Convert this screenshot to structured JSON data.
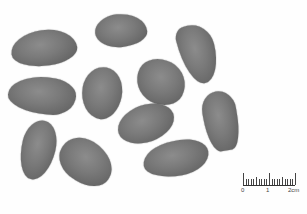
{
  "image": {
    "description": "Photograph of eleven grey ovate seeds on a white background with a centimeter scale bar",
    "background_color": "#fefefe",
    "seed_color": "#747474",
    "seed_count": 11
  },
  "seeds": [
    {
      "id": 1,
      "cx": 44,
      "cy": 48,
      "w": 66,
      "h": 36,
      "rotate": -8,
      "shape": "50% 50% 45% 55% / 55% 60% 40% 45%"
    },
    {
      "id": 2,
      "cx": 121,
      "cy": 30,
      "w": 52,
      "h": 33,
      "rotate": -6,
      "shape": "45% 55% 50% 50% / 50% 60% 40% 50%"
    },
    {
      "id": 3,
      "cx": 198,
      "cy": 54,
      "w": 36,
      "h": 60,
      "rotate": -14,
      "shape": "30% 60% 50% 50% / 20% 40% 60% 80%"
    },
    {
      "id": 4,
      "cx": 42,
      "cy": 95,
      "w": 68,
      "h": 37,
      "rotate": 5,
      "shape": "55% 40% 35% 60% / 55% 45% 55% 45%"
    },
    {
      "id": 5,
      "cx": 102,
      "cy": 93,
      "w": 40,
      "h": 52,
      "rotate": 10,
      "shape": "50% 50% 45% 55% / 45% 50% 50% 55%"
    },
    {
      "id": 6,
      "cx": 161,
      "cy": 82,
      "w": 50,
      "h": 44,
      "rotate": 28,
      "shape": "50% 50% 50% 50% / 45% 55% 45% 55%"
    },
    {
      "id": 7,
      "cx": 221,
      "cy": 121,
      "w": 34,
      "h": 60,
      "rotate": -10,
      "shape": "55% 55% 35% 40% / 35% 35% 65% 65%"
    },
    {
      "id": 8,
      "cx": 146,
      "cy": 123,
      "w": 58,
      "h": 37,
      "rotate": -20,
      "shape": "50% 50% 50% 50% / 50% 50% 50% 50%"
    },
    {
      "id": 9,
      "cx": 38,
      "cy": 150,
      "w": 34,
      "h": 60,
      "rotate": 14,
      "shape": "50% 50% 50% 50% / 40% 45% 55% 60%"
    },
    {
      "id": 10,
      "cx": 86,
      "cy": 162,
      "w": 56,
      "h": 42,
      "rotate": 32,
      "shape": "45% 60% 50% 50% / 50% 55% 45% 50%"
    },
    {
      "id": 11,
      "cx": 176,
      "cy": 158,
      "w": 66,
      "h": 35,
      "rotate": -10,
      "shape": "50% 40% 45% 55% / 55% 45% 55% 45%"
    }
  ],
  "scale_bar": {
    "labels": [
      "0",
      "1",
      "2cm"
    ],
    "unit": "cm",
    "length_cm": 2,
    "minor_ticks": 20
  }
}
